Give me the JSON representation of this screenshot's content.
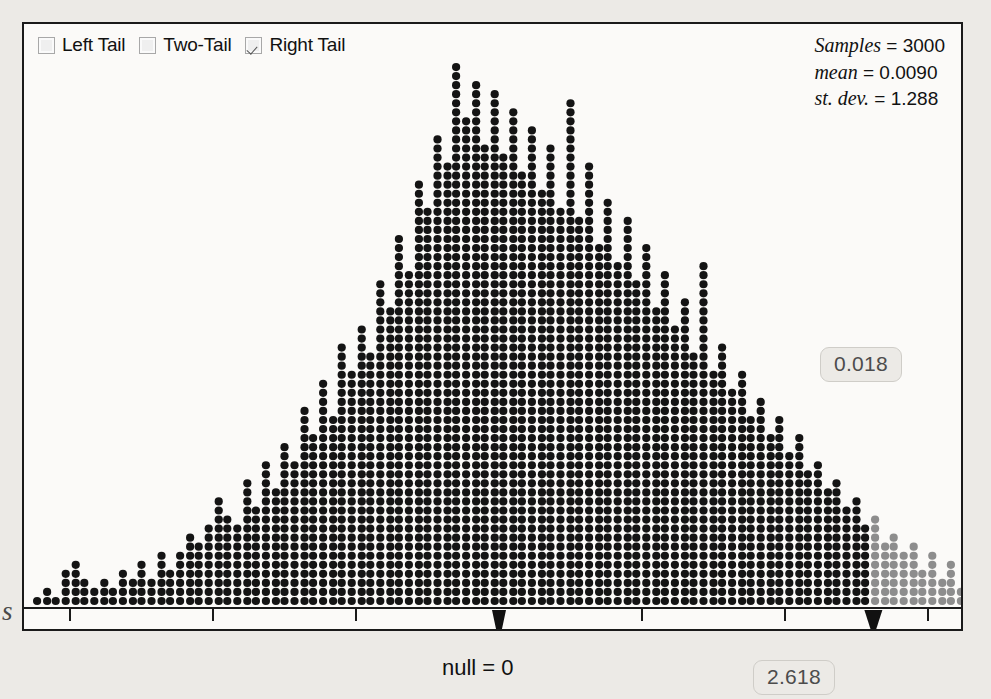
{
  "legend": {
    "items": [
      {
        "label": "Left Tail",
        "checked": false,
        "name": "left-tail"
      },
      {
        "label": "Two-Tail",
        "checked": false,
        "name": "two-tail"
      },
      {
        "label": "Right Tail",
        "checked": true,
        "name": "right-tail"
      }
    ]
  },
  "stats": {
    "samples_key": "Samples",
    "samples_value": "= 3000",
    "mean_key": "mean",
    "mean_value": "= 0.0090",
    "sd_key": "st. dev.",
    "sd_value": "= 1.288"
  },
  "annotations": {
    "p_value": "0.018",
    "test_statistic": "2.618",
    "null_label": "null = 0"
  },
  "colors": {
    "dot_normal": "#141414",
    "dot_tail": "#8d8d8d",
    "panel_background": "#fbfaf8",
    "page_background": "#eceae6",
    "border": "#1a1a1a",
    "badge_text": "#4c4c4c"
  },
  "chart_data": {
    "type": "bar",
    "title": "",
    "subtitle": "",
    "xlabel": "",
    "ylabel": "",
    "plot_style": "dotplot-histogram",
    "xlim": [
      -4.1,
      3.9
    ],
    "xticks": [
      -3,
      -2,
      -1,
      1,
      2,
      3
    ],
    "xticklabels": [
      "−3",
      "−2",
      "−1",
      "1",
      "2",
      "3"
    ],
    "grid": false,
    "legend_position": "top-left",
    "bin_width": 0.0667,
    "dot_value": 1,
    "markers": [
      {
        "name": "null",
        "x": 0,
        "label": "null = 0"
      },
      {
        "name": "test-statistic",
        "x": 2.618,
        "label": "2.618"
      }
    ],
    "tail_shading": {
      "side": "right",
      "from": 2.618,
      "p_value": 0.018
    },
    "n_samples": 3000,
    "mean": 0.009,
    "st_dev": 1.288,
    "bins_x": [
      -4.03,
      -3.96,
      -3.9,
      -3.83,
      -3.76,
      -3.7,
      -3.63,
      -3.56,
      -3.5,
      -3.43,
      -3.36,
      -3.3,
      -3.23,
      -3.16,
      -3.1,
      -3.03,
      -2.96,
      -2.9,
      -2.83,
      -2.76,
      -2.7,
      -2.63,
      -2.56,
      -2.5,
      -2.43,
      -2.36,
      -2.3,
      -2.23,
      -2.16,
      -2.1,
      -2.03,
      -1.96,
      -1.9,
      -1.83,
      -1.76,
      -1.7,
      -1.63,
      -1.56,
      -1.5,
      -1.43,
      -1.36,
      -1.3,
      -1.23,
      -1.16,
      -1.1,
      -1.03,
      -0.96,
      -0.9,
      -0.83,
      -0.76,
      -0.7,
      -0.63,
      -0.56,
      -0.5,
      -0.43,
      -0.36,
      -0.3,
      -0.23,
      -0.16,
      -0.1,
      -0.03,
      0.03,
      0.1,
      0.16,
      0.23,
      0.3,
      0.36,
      0.43,
      0.5,
      0.56,
      0.63,
      0.7,
      0.76,
      0.83,
      0.9,
      0.96,
      1.03,
      1.1,
      1.16,
      1.23,
      1.3,
      1.36,
      1.43,
      1.5,
      1.56,
      1.63,
      1.7,
      1.76,
      1.83,
      1.9,
      1.96,
      2.03,
      2.1,
      2.16,
      2.23,
      2.3,
      2.36,
      2.43,
      2.5,
      2.56,
      2.63,
      2.7,
      2.76,
      2.83,
      2.9,
      2.96,
      3.03,
      3.1,
      3.16,
      3.23,
      3.3,
      3.36,
      3.43,
      3.5,
      3.56,
      3.63,
      3.7
    ],
    "bins_count": [
      1,
      1,
      0,
      0,
      1,
      0,
      1,
      1,
      0,
      1,
      1,
      0,
      1,
      2,
      1,
      4,
      5,
      3,
      2,
      3,
      2,
      4,
      3,
      5,
      3,
      6,
      4,
      6,
      8,
      7,
      9,
      12,
      10,
      9,
      14,
      11,
      16,
      13,
      18,
      16,
      22,
      19,
      25,
      21,
      29,
      26,
      31,
      28,
      36,
      33,
      41,
      37,
      47,
      44,
      52,
      49,
      60,
      54,
      58,
      51,
      57,
      50,
      55,
      48,
      53,
      46,
      51,
      44,
      56,
      43,
      49,
      40,
      45,
      38,
      43,
      36,
      40,
      33,
      37,
      31,
      34,
      28,
      38,
      26,
      29,
      24,
      26,
      21,
      23,
      19,
      21,
      17,
      19,
      15,
      16,
      13,
      14,
      11,
      12,
      9,
      10,
      7,
      8,
      6,
      7,
      4,
      6,
      3,
      5,
      2,
      4,
      2,
      3,
      1,
      2,
      1,
      1
    ]
  }
}
